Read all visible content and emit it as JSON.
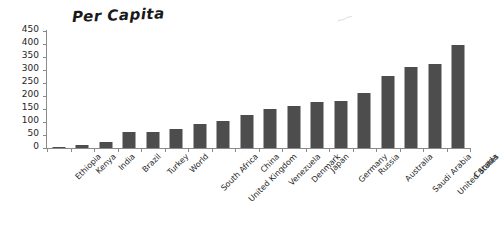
{
  "chart_data": {
    "type": "bar",
    "title": "Per Capita",
    "xlabel": "",
    "ylabel": "",
    "ylim": [
      0,
      450
    ],
    "yticks": [
      0,
      50,
      100,
      150,
      200,
      250,
      300,
      350,
      400,
      450
    ],
    "grid": false,
    "legend": null,
    "bar_color": "#4d4d4d",
    "categories": [
      "Ethiopia",
      "Kenya",
      "India",
      "Brazil",
      "Turkey",
      "World",
      "South Africa",
      "United Kingdom",
      "China",
      "Venezuela",
      "Denmark",
      "Japan",
      "Germany",
      "Russia",
      "Australia",
      "Saudi Arabia",
      "United States",
      "Canada"
    ],
    "values": [
      3,
      10,
      25,
      60,
      62,
      75,
      92,
      105,
      128,
      150,
      160,
      178,
      180,
      210,
      278,
      310,
      325,
      395
    ],
    "annotations": [
      "faint pencil smudge near top right"
    ]
  }
}
